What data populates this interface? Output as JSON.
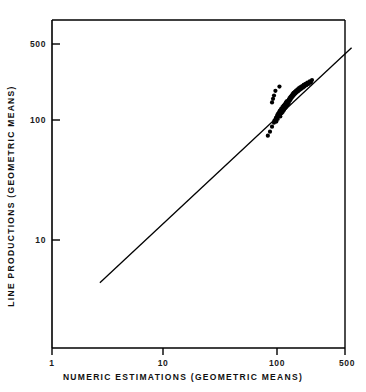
{
  "chart_data": {
    "type": "scatter",
    "title": "",
    "xlabel": "NUMERIC  ESTIMATIONS  (GEOMETRIC  MEANS)",
    "ylabel": "LINE  PRODUCTIONS  (GEOMETRIC  MEANS)",
    "xscale": "log",
    "yscale": "log",
    "xlim": [
      1,
      500
    ],
    "ylim": [
      3,
      700
    ],
    "grid": false,
    "legend": null,
    "xticks": [
      {
        "value": 1,
        "label": "1"
      },
      {
        "value": 10,
        "label": "10"
      },
      {
        "value": 100,
        "label": "100"
      },
      {
        "value": 500,
        "label": "500"
      }
    ],
    "yticks": [
      {
        "value": 10,
        "label": "10"
      },
      {
        "value": 100,
        "label": "100"
      },
      {
        "value": 500,
        "label": "500"
      }
    ],
    "reference_line": {
      "name": "identity-line",
      "x": [
        2.7,
        500
      ],
      "y": [
        4.4,
        400
      ]
    },
    "series": [
      {
        "name": "geometric-means",
        "marker": "filled-circle",
        "color": "#000000",
        "points": [
          [
            88,
            74
          ],
          [
            92,
            80
          ],
          [
            96,
            88
          ],
          [
            100,
            95
          ],
          [
            101,
            99
          ],
          [
            103,
            101
          ],
          [
            104,
            104
          ],
          [
            105,
            97
          ],
          [
            106,
            106
          ],
          [
            107,
            110
          ],
          [
            108,
            102
          ],
          [
            109,
            113
          ],
          [
            110,
            108
          ],
          [
            111,
            116
          ],
          [
            112,
            112
          ],
          [
            113,
            120
          ],
          [
            114,
            107
          ],
          [
            115,
            118
          ],
          [
            116,
            124
          ],
          [
            117,
            114
          ],
          [
            118,
            122
          ],
          [
            119,
            128
          ],
          [
            120,
            117
          ],
          [
            121,
            126
          ],
          [
            122,
            132
          ],
          [
            123,
            121
          ],
          [
            124,
            130
          ],
          [
            125,
            135
          ],
          [
            126,
            125
          ],
          [
            127,
            133
          ],
          [
            128,
            140
          ],
          [
            129,
            129
          ],
          [
            130,
            137
          ],
          [
            131,
            144
          ],
          [
            132,
            134
          ],
          [
            133,
            141
          ],
          [
            135,
            138
          ],
          [
            136,
            148
          ],
          [
            137,
            143
          ],
          [
            138,
            152
          ],
          [
            140,
            147
          ],
          [
            141,
            156
          ],
          [
            142,
            150
          ],
          [
            144,
            160
          ],
          [
            145,
            154
          ],
          [
            147,
            164
          ],
          [
            148,
            158
          ],
          [
            150,
            168
          ],
          [
            152,
            162
          ],
          [
            154,
            172
          ],
          [
            156,
            166
          ],
          [
            158,
            176
          ],
          [
            160,
            170
          ],
          [
            163,
            180
          ],
          [
            165,
            174
          ],
          [
            168,
            184
          ],
          [
            170,
            178
          ],
          [
            173,
            188
          ],
          [
            176,
            182
          ],
          [
            179,
            192
          ],
          [
            182,
            186
          ],
          [
            185,
            196
          ],
          [
            188,
            190
          ],
          [
            192,
            200
          ],
          [
            196,
            195
          ],
          [
            200,
            205
          ],
          [
            205,
            200
          ],
          [
            210,
            210
          ],
          [
            215,
            205
          ],
          [
            220,
            215
          ],
          [
            103,
            175
          ],
          [
            112,
            190
          ],
          [
            98,
            150
          ],
          [
            96,
            140
          ],
          [
            100,
            160
          ]
        ]
      }
    ]
  },
  "axes": {
    "frame_color": "#000000"
  }
}
